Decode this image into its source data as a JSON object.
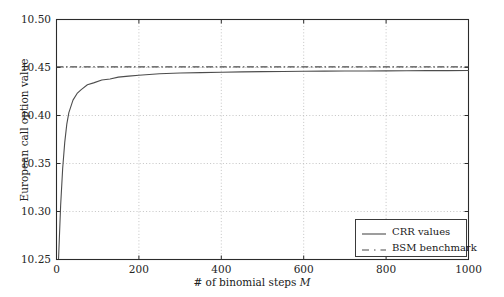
{
  "chart_data": {
    "type": "line",
    "title": "",
    "xlabel": "# of binomial steps M",
    "xlabel_prefix": "# of binomial steps ",
    "xlabel_var": "M",
    "ylabel": "European call option value",
    "xlim": [
      0,
      1000
    ],
    "ylim": [
      10.25,
      10.5
    ],
    "grid": true,
    "legend_position": "lower right",
    "xticks": [
      0,
      200,
      400,
      600,
      800,
      1000
    ],
    "xtick_labels": [
      "0",
      "200",
      "400",
      "600",
      "800",
      "1000"
    ],
    "yticks": [
      10.25,
      10.3,
      10.35,
      10.4,
      10.45,
      10.5
    ],
    "ytick_labels": [
      "10.25",
      "10.30",
      "10.35",
      "10.40",
      "10.45",
      "10.50"
    ],
    "series": [
      {
        "name": "CRR values",
        "style": "solid",
        "color": "#4d4d4d",
        "x": [
          5,
          10,
          15,
          20,
          25,
          30,
          40,
          50,
          60,
          75,
          90,
          110,
          130,
          150,
          175,
          200,
          250,
          300,
          350,
          400,
          450,
          500,
          550,
          600,
          650,
          700,
          750,
          800,
          850,
          900,
          950,
          1000
        ],
        "y": [
          10.251,
          10.306,
          10.345,
          10.372,
          10.391,
          10.403,
          10.416,
          10.423,
          10.427,
          10.432,
          10.434,
          10.437,
          10.438,
          10.44,
          10.441,
          10.442,
          10.4435,
          10.4442,
          10.4447,
          10.4451,
          10.4454,
          10.4457,
          10.4459,
          10.4461,
          10.4462,
          10.4463,
          10.4464,
          10.4465,
          10.4466,
          10.4467,
          10.4467,
          10.4468
        ]
      },
      {
        "name": "BSM benchmark",
        "style": "dashdot",
        "color": "#4a4a4a",
        "value": 10.4506
      }
    ]
  },
  "legend": {
    "entries": [
      {
        "label": "CRR values",
        "sample": "solid-line-sample"
      },
      {
        "label": "BSM benchmark",
        "sample": "dashed-line-sample"
      }
    ]
  },
  "colors": {
    "axis": "#2b2b2b",
    "grid": "#b5b5b5",
    "curve": "#4d4d4d",
    "benchmark": "#4a4a4a",
    "background": "#ffffff"
  }
}
